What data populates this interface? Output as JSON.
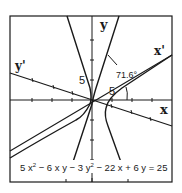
{
  "diagram": {
    "type": "rotated-conic-hyperbola",
    "axes": {
      "x_label": "x",
      "y_label": "y",
      "x_rot_label": "x'",
      "y_rot_label": "y'",
      "tick_label_x": "5",
      "tick_label_y": "5"
    },
    "angle_label": "71.6°",
    "equation": "5x² − 6xy − 3y² − 22x + 6y = 25",
    "equation_parts": {
      "t1": "5 x",
      "e1": "2",
      "t2": " − 6 x y − 3 y",
      "e2": "2",
      "t3": " − 22 x + 6 y = 25"
    },
    "colors": {
      "line": "#1a1a1a",
      "background": "#ffffff"
    }
  }
}
